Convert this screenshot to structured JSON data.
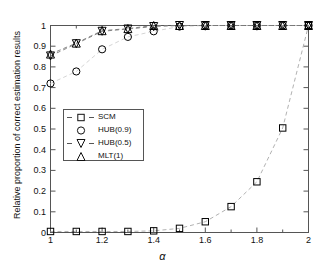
{
  "chart_data": {
    "type": "line",
    "title": "",
    "xlabel": "α",
    "ylabel": "Relative proportion of correct estimation results",
    "xlim": [
      1,
      2
    ],
    "ylim": [
      0,
      1
    ],
    "grid": false,
    "legend_position": "center-left",
    "x": [
      1.0,
      1.1,
      1.2,
      1.3,
      1.4,
      1.5,
      1.6,
      1.7,
      1.8,
      1.9,
      2.0
    ],
    "xticks": [
      1,
      1.2,
      1.4,
      1.6,
      1.8,
      2
    ],
    "xticklabels": [
      "1",
      "1.2",
      "1.4",
      "1.6",
      "1.8",
      "2"
    ],
    "yticks": [
      0,
      0.1,
      0.2,
      0.3,
      0.4,
      0.5,
      0.6,
      0.7,
      0.8,
      0.9,
      1
    ],
    "yticklabels": [
      "0",
      "0.1",
      "0.2",
      "0.3",
      "0.4",
      "0.5",
      "0.6",
      "0.7",
      "0.8",
      "0.9",
      "1"
    ],
    "series": [
      {
        "name": "SCM",
        "marker": "square",
        "line": "dashed",
        "color": "#000000",
        "line_color": "#a8a8a8",
        "values": [
          0.005,
          0.005,
          0.005,
          0.005,
          0.008,
          0.02,
          0.052,
          0.125,
          0.245,
          0.505,
          1.0
        ]
      },
      {
        "name": "HUB(0.9)",
        "marker": "circle",
        "line": "none",
        "color": "#000000",
        "line_color": "#d0d0d0",
        "values": [
          0.72,
          0.778,
          0.885,
          0.945,
          0.972,
          0.995,
          1.0,
          1.0,
          1.0,
          1.0,
          1.0
        ]
      },
      {
        "name": "HUB(0.5)",
        "marker": "triangle-down",
        "line": "dashed",
        "color": "#000000",
        "line_color": "#7a7a7a",
        "values": [
          0.853,
          0.912,
          0.972,
          0.983,
          0.995,
          1.0,
          1.0,
          1.0,
          1.0,
          1.0,
          1.0
        ]
      },
      {
        "name": "MLT(1)",
        "marker": "triangle-up",
        "line": "none",
        "color": "#000000",
        "line_color": "#7a7a7a",
        "values": [
          0.862,
          0.915,
          0.975,
          0.985,
          1.0,
          1.0,
          1.0,
          1.0,
          1.0,
          1.0,
          1.0
        ]
      }
    ],
    "legend_entries": [
      "SCM",
      "HUB(0.9)",
      "HUB(0.5)",
      "MLT(1)"
    ]
  }
}
